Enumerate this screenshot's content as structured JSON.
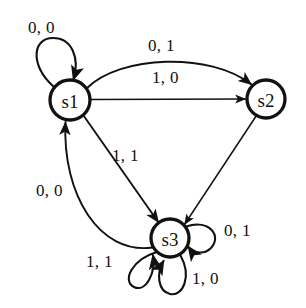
{
  "diagram": {
    "type": "finite-state-machine",
    "background_color": "#ffffff",
    "stroke_color": "#111111",
    "nodes": [
      {
        "id": "s1",
        "label": "s1",
        "cx": 70,
        "cy": 100,
        "r": 20
      },
      {
        "id": "s2",
        "label": "s2",
        "cx": 266,
        "cy": 99,
        "r": 19
      },
      {
        "id": "s3",
        "label": "s3",
        "cx": 170,
        "cy": 238,
        "r": 19
      }
    ],
    "edges": [
      {
        "id": "e-s1-s1",
        "from": "s1",
        "to": "s1",
        "label": "0, 0",
        "kind": "self-loop",
        "label_x": 28,
        "label_y": 19
      },
      {
        "id": "e-s1-s2-curved",
        "from": "s1",
        "to": "s2",
        "label": "0, 1",
        "kind": "curved",
        "label_x": 148,
        "label_y": 37
      },
      {
        "id": "e-s1-s2-straight",
        "from": "s1",
        "to": "s2",
        "label": "1, 0",
        "kind": "straight",
        "label_x": 152,
        "label_y": 69
      },
      {
        "id": "e-s1-s3",
        "from": "s1",
        "to": "s3",
        "label": "1, 1",
        "kind": "straight",
        "label_x": 112,
        "label_y": 147
      },
      {
        "id": "e-s3-s1",
        "from": "s3",
        "to": "s1",
        "label": "0, 0",
        "kind": "curved",
        "label_x": 36,
        "label_y": 182
      },
      {
        "id": "e-s2-s3",
        "from": "s2",
        "to": "s3",
        "label": "",
        "kind": "straight",
        "label_x": null,
        "label_y": null
      },
      {
        "id": "e-s3-s3-right",
        "from": "s3",
        "to": "s3",
        "label": "0, 1",
        "kind": "self-loop",
        "label_x": 224,
        "label_y": 222
      },
      {
        "id": "e-s3-s3-bottom",
        "from": "s3",
        "to": "s3",
        "label": "1, 0",
        "kind": "self-loop",
        "label_x": 192,
        "label_y": 270
      },
      {
        "id": "e-s3-s3-left",
        "from": "s3",
        "to": "s3",
        "label": "1, 1",
        "kind": "self-loop",
        "label_x": 86,
        "label_y": 253
      }
    ]
  }
}
